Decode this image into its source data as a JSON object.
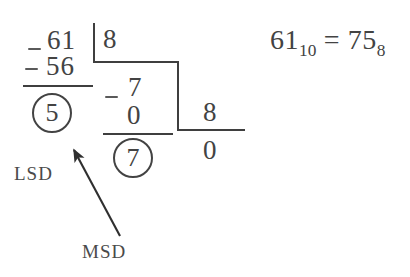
{
  "diagram": {
    "ink_color": "#434343",
    "background_color": "#ffffff"
  },
  "equation": {
    "value": "61",
    "value_base": "10",
    "equals": "=",
    "result": "75",
    "result_base": "8"
  },
  "division_steps": [
    {
      "dividend": "61",
      "minus_sign": "–",
      "subtrahend": "56",
      "divisor": "8",
      "remainder": "5"
    },
    {
      "dividend": "7",
      "minus_sign": "–",
      "subtrahend": "0",
      "divisor": "8",
      "remainder": "7"
    },
    {
      "dividend": "0",
      "divisor": "8"
    }
  ],
  "columns": {
    "first": {
      "top": "61",
      "minus": "–",
      "bottom": "56",
      "circled_remainder": "5"
    },
    "second": {
      "top": "7",
      "minus": "–",
      "bottom": "0",
      "circled_remainder": "7"
    },
    "third": {
      "quotient": "8",
      "final": "0"
    }
  },
  "divisors": {
    "first": "8",
    "second": "8"
  },
  "annotations": {
    "lsd_label": "LSD",
    "msd_label": "MSD",
    "arrow_name": "msd-pointer-arrow"
  }
}
